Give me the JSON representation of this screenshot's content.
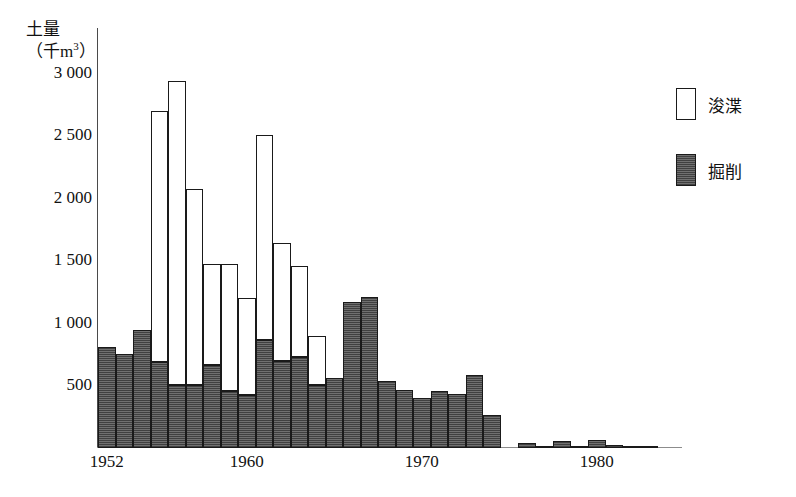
{
  "axis": {
    "y_title_line1": "土量",
    "y_title_line2_prefix": "（千m",
    "y_title_line2_sup": "3",
    "y_title_line2_suffix": "）"
  },
  "legend": {
    "items": [
      {
        "label": "浚渫",
        "swatch": "light",
        "color": "#ffffff"
      },
      {
        "label": "掘削",
        "swatch": "dark",
        "color": "#5b5b5b"
      }
    ]
  },
  "chart_data": {
    "type": "bar",
    "stacked": true,
    "title": "",
    "xlabel": "",
    "ylabel": "土量（千m3）",
    "ylim": [
      0,
      3100
    ],
    "grid": false,
    "legend_position": "right",
    "y_ticks": [
      500,
      1000,
      1500,
      2000,
      2500,
      3000
    ],
    "y_tick_labels": [
      "500",
      "1 000",
      "1 500",
      "2 000",
      "2 500",
      "3 000"
    ],
    "x_ticks": [
      1952,
      1960,
      1970,
      1980
    ],
    "x_tick_labels": [
      "1952",
      "1960",
      "1970",
      "1980"
    ],
    "x_range": [
      1952,
      1984
    ],
    "categories": [
      1952,
      1953,
      1954,
      1955,
      1956,
      1957,
      1958,
      1959,
      1960,
      1961,
      1962,
      1963,
      1964,
      1965,
      1966,
      1967,
      1968,
      1969,
      1970,
      1971,
      1972,
      1973,
      1974,
      1975,
      1976,
      1977,
      1978,
      1979,
      1980,
      1981,
      1982,
      1983
    ],
    "series": [
      {
        "name": "掘削",
        "color": "#5b5b5b",
        "values": [
          810,
          755,
          945,
          690,
          505,
          505,
          660,
          455,
          425,
          860,
          695,
          725,
          505,
          560,
          1170,
          1205,
          535,
          465,
          400,
          455,
          435,
          585,
          265,
          0,
          40,
          20,
          60,
          20,
          65,
          25,
          20,
          10
        ]
      },
      {
        "name": "浚渫",
        "color": "#ffffff",
        "values": [
          0,
          0,
          0,
          2005,
          2425,
          1565,
          810,
          1015,
          770,
          1640,
          940,
          730,
          390,
          0,
          0,
          0,
          0,
          0,
          0,
          0,
          0,
          0,
          0,
          0,
          0,
          0,
          0,
          0,
          0,
          0,
          0,
          0
        ]
      }
    ],
    "totals": [
      810,
      755,
      945,
      2695,
      2930,
      2070,
      1470,
      1470,
      1195,
      2500,
      1635,
      1455,
      895,
      560,
      1170,
      1205,
      535,
      465,
      400,
      455,
      435,
      585,
      265,
      0,
      40,
      20,
      60,
      20,
      65,
      25,
      20,
      10
    ]
  }
}
